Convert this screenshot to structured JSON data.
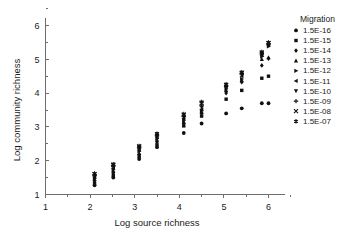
{
  "chart_data": {
    "type": "scatter",
    "title": "",
    "xlabel": "Log source richness",
    "ylabel": "Log community richness",
    "xlim": [
      1,
      6.35
    ],
    "ylim": [
      1,
      6.35
    ],
    "xticks": [
      1,
      2,
      3,
      4,
      5,
      6
    ],
    "xticklabels": [
      "1",
      "2",
      "3",
      "4",
      "5",
      "6"
    ],
    "yticks": [
      1,
      2,
      3,
      4,
      5,
      6
    ],
    "yticklabels": [
      "1",
      "2",
      "3",
      "4",
      "5",
      "6"
    ],
    "grid": false,
    "legend_position": "right",
    "legend_title": "Migration",
    "series": [
      {
        "name": "1.5E-16",
        "marker": "circle",
        "points": [
          [
            2.1,
            1.27
          ],
          [
            2.52,
            1.5
          ],
          [
            3.1,
            2.05
          ],
          [
            3.5,
            2.4
          ],
          [
            4.1,
            2.82
          ],
          [
            4.5,
            3.1
          ],
          [
            5.05,
            3.4
          ],
          [
            5.4,
            3.55
          ],
          [
            5.85,
            3.7
          ],
          [
            6.0,
            3.7
          ]
        ]
      },
      {
        "name": "1.5E-15",
        "marker": "square",
        "points": [
          [
            2.1,
            1.33
          ],
          [
            2.52,
            1.57
          ],
          [
            3.1,
            2.13
          ],
          [
            3.5,
            2.47
          ],
          [
            4.1,
            3.03
          ],
          [
            4.5,
            3.32
          ],
          [
            5.05,
            3.82
          ],
          [
            5.4,
            4.08
          ],
          [
            5.85,
            4.44
          ],
          [
            6.0,
            4.5
          ]
        ]
      },
      {
        "name": "1.5E-14",
        "marker": "diamond",
        "points": [
          [
            2.1,
            1.4
          ],
          [
            2.52,
            1.64
          ],
          [
            3.1,
            2.18
          ],
          [
            3.5,
            2.55
          ],
          [
            4.1,
            3.1
          ],
          [
            4.5,
            3.4
          ],
          [
            5.05,
            4.0
          ],
          [
            5.4,
            4.32
          ],
          [
            5.85,
            4.82
          ],
          [
            6.0,
            5.02
          ]
        ]
      },
      {
        "name": "1.5E-13",
        "marker": "triangle-up",
        "points": [
          [
            2.1,
            1.45
          ],
          [
            2.52,
            1.7
          ],
          [
            3.1,
            2.22
          ],
          [
            3.5,
            2.62
          ],
          [
            4.1,
            3.15
          ],
          [
            4.5,
            3.45
          ],
          [
            5.05,
            4.08
          ],
          [
            5.4,
            4.38
          ],
          [
            5.85,
            5.0
          ],
          [
            6.0,
            5.05
          ]
        ]
      },
      {
        "name": "1.5E-12",
        "marker": "triangle-right",
        "points": [
          [
            2.1,
            1.48
          ],
          [
            2.52,
            1.74
          ],
          [
            3.1,
            2.28
          ],
          [
            3.5,
            2.66
          ],
          [
            4.1,
            3.2
          ],
          [
            4.5,
            3.48
          ],
          [
            5.05,
            4.12
          ],
          [
            5.4,
            4.42
          ],
          [
            5.85,
            5.08
          ],
          [
            6.0,
            5.38
          ]
        ]
      },
      {
        "name": "1.5E-11",
        "marker": "triangle-left",
        "points": [
          [
            2.1,
            1.52
          ],
          [
            2.52,
            1.78
          ],
          [
            3.1,
            2.32
          ],
          [
            3.5,
            2.7
          ],
          [
            4.1,
            3.25
          ],
          [
            4.5,
            3.52
          ],
          [
            5.05,
            4.18
          ],
          [
            5.4,
            4.5
          ],
          [
            5.85,
            5.12
          ],
          [
            6.0,
            5.42
          ]
        ]
      },
      {
        "name": "1.5E-10",
        "marker": "triangle-down",
        "points": [
          [
            2.1,
            1.55
          ],
          [
            2.52,
            1.82
          ],
          [
            3.1,
            2.36
          ],
          [
            3.5,
            2.74
          ],
          [
            4.1,
            3.28
          ],
          [
            4.5,
            3.58
          ],
          [
            5.05,
            4.2
          ],
          [
            5.4,
            4.55
          ],
          [
            5.85,
            5.15
          ],
          [
            6.0,
            5.44
          ]
        ]
      },
      {
        "name": "1.5E-09",
        "marker": "plus",
        "points": [
          [
            2.1,
            1.58
          ],
          [
            2.52,
            1.86
          ],
          [
            3.1,
            2.4
          ],
          [
            3.5,
            2.76
          ],
          [
            4.1,
            3.32
          ],
          [
            4.5,
            3.62
          ],
          [
            5.05,
            4.22
          ],
          [
            5.4,
            4.58
          ],
          [
            5.85,
            5.18
          ],
          [
            6.0,
            5.46
          ]
        ]
      },
      {
        "name": "1.5E-08",
        "marker": "x",
        "points": [
          [
            2.1,
            1.6
          ],
          [
            2.52,
            1.88
          ],
          [
            3.1,
            2.42
          ],
          [
            3.5,
            2.78
          ],
          [
            4.1,
            3.36
          ],
          [
            4.5,
            3.7
          ],
          [
            5.05,
            4.24
          ],
          [
            5.4,
            4.6
          ],
          [
            5.85,
            5.2
          ],
          [
            6.0,
            5.48
          ]
        ]
      },
      {
        "name": "1.5E-07",
        "marker": "asterisk",
        "points": [
          [
            2.1,
            1.62
          ],
          [
            2.52,
            1.9
          ],
          [
            3.1,
            2.44
          ],
          [
            3.5,
            2.8
          ],
          [
            4.1,
            3.38
          ],
          [
            4.5,
            3.74
          ],
          [
            5.05,
            4.26
          ],
          [
            5.4,
            4.62
          ],
          [
            5.85,
            5.22
          ],
          [
            6.0,
            5.5
          ]
        ]
      }
    ]
  },
  "legend": {
    "title": "Migration",
    "items": [
      {
        "label": "1.5E-16",
        "marker": "circle"
      },
      {
        "label": "1.5E-15",
        "marker": "square"
      },
      {
        "label": "1.5E-14",
        "marker": "diamond"
      },
      {
        "label": "1.5E-13",
        "marker": "triangle-up"
      },
      {
        "label": "1.5E-12",
        "marker": "triangle-right"
      },
      {
        "label": "1.5E-11",
        "marker": "triangle-left"
      },
      {
        "label": "1.5E-10",
        "marker": "triangle-down"
      },
      {
        "label": "1.5E-09",
        "marker": "plus"
      },
      {
        "label": "1.5E-08",
        "marker": "x"
      },
      {
        "label": "1.5E-07",
        "marker": "asterisk"
      }
    ]
  },
  "colors": {
    "marker": "#111111",
    "axis": "#6e6e6e",
    "text": "#1a1a1a",
    "background": "#ffffff"
  }
}
